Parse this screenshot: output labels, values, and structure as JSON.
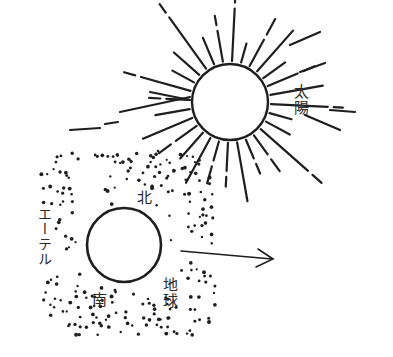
{
  "diagram": {
    "sun": {
      "label": "太陽",
      "center": [
        230,
        102
      ],
      "radius": 38,
      "ray_count": 28
    },
    "earth": {
      "label": "地球",
      "center": [
        124,
        245
      ],
      "radius": 37,
      "north_label": "北",
      "south_label": "南"
    },
    "ether": {
      "label": "エーテル"
    },
    "arrow": {
      "from": [
        182,
        252
      ],
      "to": [
        272,
        260
      ],
      "direction": "right"
    },
    "colors": {
      "ink": "#1e1e1e",
      "background": "#ffffff"
    }
  }
}
